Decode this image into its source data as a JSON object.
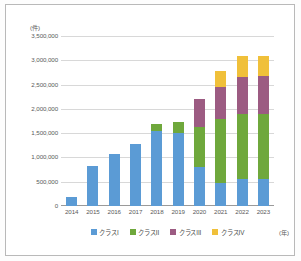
{
  "chart_data": {
    "type": "bar",
    "stacked": true,
    "title": "",
    "xlabel": "(年)",
    "ylabel": "(件)",
    "ylim": [
      0,
      3500000
    ],
    "ytick_labels": [
      "3,500,000",
      "3,000,000",
      "2,500,000",
      "2,000,000",
      "1,500,000",
      "1,000,000",
      "500,000",
      "0"
    ],
    "ytick_values": [
      3500000,
      3000000,
      2500000,
      2000000,
      1500000,
      1000000,
      500000,
      0
    ],
    "grid": true,
    "legend_position": "bottom",
    "categories": [
      "2014",
      "2015",
      "2016",
      "2017",
      "2018",
      "2019",
      "2020",
      "2021",
      "2022",
      "2023"
    ],
    "series": [
      {
        "name": "クラスI",
        "color": "#5b9bd5",
        "values": [
          180000,
          820000,
          1080000,
          1270000,
          1540000,
          1500000,
          800000,
          480000,
          560000,
          560000
        ]
      },
      {
        "name": "クラスII",
        "color": "#6fa83c",
        "values": [
          0,
          0,
          0,
          0,
          140000,
          220000,
          820000,
          1310000,
          1340000,
          1330000
        ]
      },
      {
        "name": "クラスIII",
        "color": "#9c5b82",
        "values": [
          0,
          0,
          0,
          0,
          0,
          0,
          590000,
          660000,
          760000,
          780000
        ]
      },
      {
        "name": "クラスIV",
        "color": "#f0c03a",
        "values": [
          0,
          0,
          0,
          0,
          0,
          0,
          0,
          320000,
          420000,
          420000
        ]
      }
    ],
    "totals": [
      180000,
      820000,
      1080000,
      1270000,
      1680000,
      1720000,
      2210000,
      2770000,
      3080000,
      3090000
    ]
  }
}
